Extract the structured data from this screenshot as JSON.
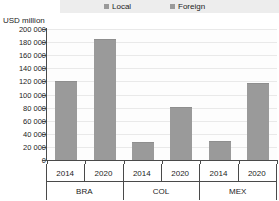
{
  "axis_title": "USD million",
  "legend": {
    "items": [
      {
        "label": "Local",
        "color": "#9a9a9a",
        "icon": "legend-swatch-icon"
      },
      {
        "label": "Foreign",
        "color": "#9a9a9a",
        "icon": "legend-swatch-icon"
      }
    ]
  },
  "chart_data": {
    "type": "bar",
    "title": "",
    "subtitle": "",
    "xlabel": "",
    "ylabel": "USD million",
    "ylim": [
      0,
      200000
    ],
    "ytick_labels": [
      "200 000",
      "180 000",
      "160 000",
      "140 000",
      "120 000",
      "100 000",
      "80 000",
      "60 000",
      "40 000",
      "20 000",
      "0"
    ],
    "ytick_values": [
      200000,
      180000,
      160000,
      140000,
      120000,
      100000,
      80000,
      60000,
      40000,
      20000,
      0
    ],
    "grid": true,
    "legend_position": "top",
    "groups": [
      "BRA",
      "COL",
      "MEX"
    ],
    "categories": [
      "2014",
      "2020",
      "2014",
      "2020",
      "2014",
      "2020"
    ],
    "bars": [
      {
        "group": "BRA",
        "year": "2014",
        "value": 120000
      },
      {
        "group": "BRA",
        "year": "2020",
        "value": 185000
      },
      {
        "group": "COL",
        "year": "2014",
        "value": 27000
      },
      {
        "group": "COL",
        "year": "2020",
        "value": 81000
      },
      {
        "group": "MEX",
        "year": "2014",
        "value": 29000
      },
      {
        "group": "MEX",
        "year": "2020",
        "value": 117000
      }
    ],
    "series": [
      {
        "name": "Local",
        "values": [
          120000,
          185000,
          27000,
          81000,
          29000,
          117000
        ]
      }
    ],
    "bar_color": "#9a9a9a"
  }
}
